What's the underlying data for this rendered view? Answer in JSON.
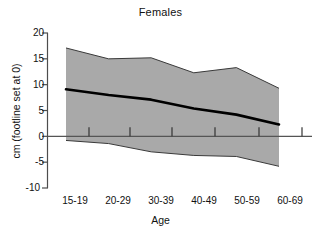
{
  "chart_data": {
    "type": "area",
    "title": "Females",
    "xlabel": "Age",
    "ylabel": "cm (footline set at 0)",
    "categories": [
      "15-19",
      "20-29",
      "30-39",
      "40-49",
      "50-59",
      "60-69"
    ],
    "ylim": [
      -10,
      20
    ],
    "yticks": [
      -10,
      -5,
      0,
      5,
      10,
      15,
      20
    ],
    "ytick_labels": [
      "-10",
      "-5",
      "0",
      "5",
      "10",
      "15",
      "20"
    ],
    "grid": false,
    "legend": "none",
    "reference_line": 0,
    "series": [
      {
        "name": "Upper limit",
        "role": "band-upper",
        "values": [
          17.1,
          15.0,
          15.2,
          12.3,
          13.3,
          9.3
        ]
      },
      {
        "name": "Median",
        "role": "center-line",
        "values": [
          9.1,
          8.0,
          7.1,
          5.4,
          4.2,
          2.3
        ]
      },
      {
        "name": "Lower limit",
        "role": "band-lower",
        "values": [
          -0.8,
          -1.4,
          -3.0,
          -3.7,
          -3.9,
          -5.8
        ]
      }
    ],
    "band_color": "#a9a9a9",
    "line_color": "#000000",
    "axis_color": "#4d4d4d",
    "rug_ticks": [
      1,
      2,
      3,
      4,
      5,
      6,
      7
    ]
  }
}
